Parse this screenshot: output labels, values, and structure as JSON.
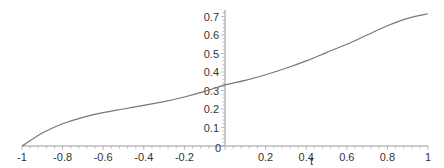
{
  "chart_data": {
    "type": "line",
    "title": "",
    "xlabel": "t",
    "ylabel": "",
    "xlim": [
      -1,
      1
    ],
    "ylim": [
      0,
      0.72
    ],
    "grid": false,
    "legend": null,
    "x_ticks": [
      "-1",
      "-0.8",
      "-0.6",
      "-0.4",
      "-0.2",
      "0",
      "0.2",
      "0.4",
      "0.6",
      "0.8",
      "1"
    ],
    "y_ticks": [
      "0.1",
      "0.2",
      "0.3",
      "0.4",
      "0.5",
      "0.6",
      "0.7"
    ],
    "series": [
      {
        "name": "curve",
        "color": "#777777",
        "x": [
          -1.0,
          -0.9,
          -0.8,
          -0.7,
          -0.6,
          -0.5,
          -0.4,
          -0.3,
          -0.2,
          -0.1,
          0.0,
          0.1,
          0.2,
          0.3,
          0.4,
          0.5,
          0.6,
          0.7,
          0.8,
          0.9,
          1.0
        ],
        "y": [
          0.0,
          0.07,
          0.12,
          0.155,
          0.18,
          0.2,
          0.22,
          0.24,
          0.265,
          0.295,
          0.33,
          0.355,
          0.385,
          0.42,
          0.46,
          0.505,
          0.55,
          0.6,
          0.65,
          0.69,
          0.715
        ]
      }
    ]
  },
  "axes": {
    "x_label": "t",
    "origin_label": "0"
  }
}
